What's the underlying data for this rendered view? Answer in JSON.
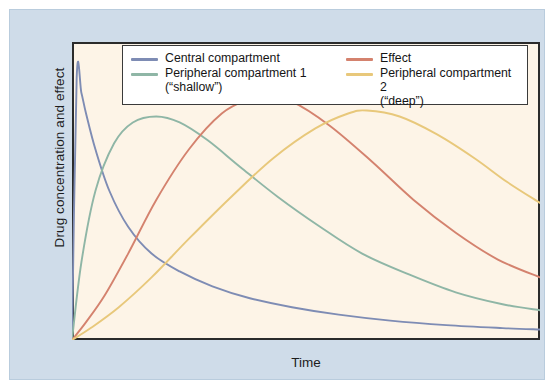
{
  "figure": {
    "panel_bg": "#cfdce9",
    "plot_bg": "#fdf4e7",
    "axis_color": "#2b2b2b"
  },
  "chart_data": {
    "type": "line",
    "title": "",
    "xlabel": "Time",
    "ylabel": "Drug concentration and effect",
    "grid": false,
    "legend_position": "top-center",
    "xlim": [
      0,
      100
    ],
    "ylim": [
      0,
      100
    ],
    "x_ticks": [
      8,
      21,
      34,
      47,
      60,
      73,
      86
    ],
    "x_tick_labels": [
      "",
      "",
      "",
      "",
      "",
      "",
      ""
    ],
    "y_ticks": [
      25,
      50,
      75
    ],
    "y_tick_labels": [
      "",
      "",
      ""
    ],
    "series": [
      {
        "name": "Central compartment",
        "color": "#7e8cb4",
        "note": "sharp initial peak then biexponential decay",
        "x": [
          0,
          1,
          2,
          3,
          5,
          8,
          12,
          17,
          23,
          30,
          38,
          47,
          57,
          68,
          80,
          92,
          100
        ],
        "y": [
          0,
          88,
          83,
          76,
          64,
          50,
          38,
          29,
          23,
          18,
          14,
          11,
          8.5,
          6.5,
          5,
          4,
          3.5
        ]
      },
      {
        "name": "Peripheral compartment 1 (\"shallow\")",
        "color": "#8fb6a6",
        "note": "rapid rise, early peak ~t=18, slow decline",
        "x": [
          0,
          2,
          5,
          9,
          13,
          18,
          23,
          29,
          36,
          44,
          53,
          62,
          72,
          82,
          92,
          100
        ],
        "y": [
          0,
          26,
          50,
          66,
          73,
          75,
          73,
          67,
          58,
          48,
          38,
          29,
          22,
          16,
          12,
          10
        ]
      },
      {
        "name": "Effect",
        "color": "#d4826e",
        "note": "delayed rise, peak ~t=41, gradual decline",
        "x": [
          0,
          3,
          7,
          12,
          18,
          25,
          32,
          38,
          41,
          47,
          55,
          64,
          73,
          82,
          91,
          100
        ],
        "y": [
          0,
          6,
          15,
          29,
          47,
          64,
          76,
          81,
          82,
          80,
          72,
          60,
          47,
          36,
          27,
          21
        ]
      },
      {
        "name": "Peripheral compartment 2 (\"deep\")",
        "color": "#e8c87b",
        "note": "slowest kinetics, peak ~t=63, very slow decline",
        "x": [
          0,
          4,
          10,
          17,
          25,
          34,
          43,
          52,
          59,
          63,
          70,
          78,
          86,
          93,
          100
        ],
        "y": [
          0,
          4,
          11,
          21,
          34,
          48,
          61,
          71,
          76,
          77,
          75,
          69,
          61,
          53,
          46
        ]
      }
    ]
  },
  "legend": {
    "entries": [
      {
        "label": "Central compartment",
        "color": "#7e8cb4"
      },
      {
        "label": "Peripheral compartment 1\n(“shallow”)",
        "color": "#8fb6a6"
      },
      {
        "label": "Effect",
        "color": "#d4826e"
      },
      {
        "label": "Peripheral compartment 2\n(“deep”)",
        "color": "#e8c87b"
      }
    ]
  }
}
